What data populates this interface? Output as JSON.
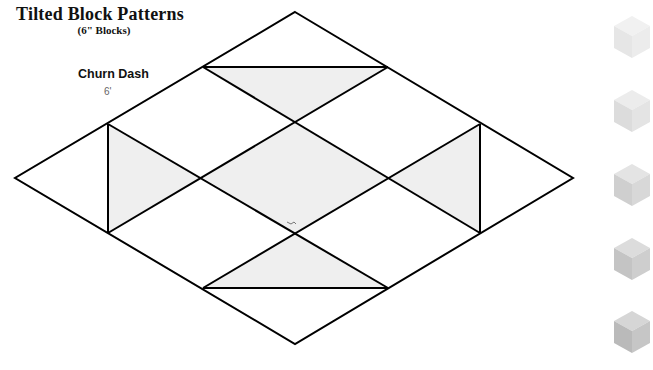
{
  "header": {
    "title": "Tilted Block Patterns",
    "subtitle": "(6\" Blocks)"
  },
  "pattern": {
    "name": "Churn Dash",
    "size_label": "6'"
  },
  "diagram": {
    "outline_color": "#000000",
    "shade_color": "#efefef",
    "vertices": {
      "top": [
        295,
        12
      ],
      "right": [
        573,
        178
      ],
      "bottom": [
        295,
        344
      ],
      "left": [
        15,
        178
      ]
    },
    "shaded_regions": [
      "top-triangle",
      "left-triangle",
      "center-rhombus",
      "right-triangle",
      "bottom-triangle"
    ]
  },
  "swatches": [
    {
      "name": "cube-1",
      "top": "#f1f1f1",
      "left": "#e6e6e6",
      "right": "#ececec"
    },
    {
      "name": "cube-2",
      "top": "#ececec",
      "left": "#dcdcdc",
      "right": "#e4e4e4"
    },
    {
      "name": "cube-3",
      "top": "#e4e4e4",
      "left": "#cfcfcf",
      "right": "#d8d8d8"
    },
    {
      "name": "cube-4",
      "top": "#dcdcdc",
      "left": "#c4c4c4",
      "right": "#cecece"
    },
    {
      "name": "cube-5",
      "top": "#d6d6d6",
      "left": "#bababa",
      "right": "#c6c6c6"
    }
  ]
}
